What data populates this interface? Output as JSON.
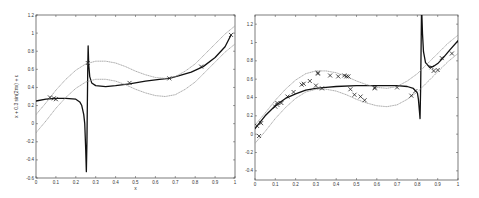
{
  "chart_data": [
    {
      "type": "line",
      "panel": "left",
      "title": "",
      "xlabel": "x",
      "ylabel": "x + 0.3 sin(2πx) + ε",
      "xlim": [
        0,
        1
      ],
      "ylim": [
        -0.6,
        1.2
      ],
      "xticks": [
        0,
        0.1,
        0.2,
        0.3,
        0.4,
        0.5,
        0.6,
        0.7,
        0.8,
        0.9,
        1
      ],
      "xtick_labels": [
        "0",
        "0.1",
        "0.2",
        "0.3",
        "0.4",
        "0.5",
        "0.6",
        "0.7",
        "0.8",
        "0.9",
        "1"
      ],
      "yticks": [
        -0.6,
        -0.4,
        -0.2,
        0,
        0.2,
        0.4,
        0.6,
        0.8,
        1,
        1.2
      ],
      "ytick_labels": [
        "-0.6",
        "-0.4",
        "-0.2",
        "0",
        "0.2",
        "0.4",
        "0.6",
        "0.8",
        "1",
        "1.2"
      ],
      "grid": false,
      "series": [
        {
          "name": "fit",
          "style": "solid",
          "color": "#111111",
          "x": [
            0,
            0.05,
            0.1,
            0.15,
            0.2,
            0.22,
            0.23,
            0.24,
            0.245,
            0.25,
            0.253,
            0.256,
            0.26,
            0.262,
            0.265,
            0.27,
            0.28,
            0.3,
            0.35,
            0.4,
            0.47,
            0.55,
            0.62,
            0.67,
            0.72,
            0.78,
            0.84,
            0.9,
            0.95,
            0.98
          ],
          "y": [
            0.25,
            0.27,
            0.28,
            0.28,
            0.27,
            0.24,
            0.2,
            0.1,
            0.0,
            -0.3,
            -0.53,
            -0.2,
            0.6,
            0.86,
            0.65,
            0.52,
            0.45,
            0.42,
            0.41,
            0.42,
            0.44,
            0.47,
            0.49,
            0.5,
            0.53,
            0.57,
            0.63,
            0.73,
            0.85,
            0.98
          ]
        },
        {
          "name": "upper band",
          "style": "dotted",
          "color": "#999999",
          "x": [
            0,
            0.05,
            0.1,
            0.15,
            0.2,
            0.25,
            0.3,
            0.35,
            0.4,
            0.45,
            0.5,
            0.55,
            0.6,
            0.65,
            0.7,
            0.75,
            0.8,
            0.85,
            0.9,
            0.95,
            1
          ],
          "y": [
            0.1,
            0.23,
            0.37,
            0.49,
            0.59,
            0.66,
            0.69,
            0.69,
            0.67,
            0.63,
            0.58,
            0.54,
            0.51,
            0.5,
            0.52,
            0.58,
            0.66,
            0.77,
            0.88,
            0.99,
            1.08
          ]
        },
        {
          "name": "lower band",
          "style": "dotted",
          "color": "#999999",
          "x": [
            0,
            0.05,
            0.1,
            0.15,
            0.2,
            0.25,
            0.3,
            0.35,
            0.4,
            0.45,
            0.5,
            0.55,
            0.6,
            0.65,
            0.7,
            0.75,
            0.8,
            0.85,
            0.9,
            0.95,
            1
          ],
          "y": [
            -0.1,
            0.03,
            0.17,
            0.29,
            0.39,
            0.46,
            0.49,
            0.49,
            0.47,
            0.43,
            0.38,
            0.34,
            0.31,
            0.3,
            0.32,
            0.38,
            0.46,
            0.57,
            0.68,
            0.79,
            0.88
          ]
        }
      ],
      "points": {
        "name": "data",
        "marker": "x",
        "x": [
          0.07,
          0.09,
          0.1,
          0.26,
          0.47,
          0.67,
          0.83,
          0.98
        ],
        "y": [
          0.29,
          0.28,
          0.27,
          0.67,
          0.45,
          0.5,
          0.63,
          0.98
        ]
      }
    },
    {
      "type": "line",
      "panel": "right",
      "title": "",
      "xlabel": "",
      "ylabel": "",
      "xlim": [
        0,
        1
      ],
      "ylim": [
        -0.5,
        1.3
      ],
      "xticks": [
        0,
        0.1,
        0.2,
        0.3,
        0.4,
        0.5,
        0.6,
        0.7,
        0.8,
        0.9,
        1
      ],
      "xtick_labels": [
        "0",
        "0.1",
        "0.2",
        "0.3",
        "0.4",
        "0.5",
        "0.6",
        "0.7",
        "0.8",
        "0.9",
        "1"
      ],
      "yticks": [
        -0.4,
        -0.2,
        0,
        0.2,
        0.4,
        0.6,
        0.8,
        1,
        1.2
      ],
      "ytick_labels": [
        "-0.4",
        "-0.2",
        "0",
        "0.2",
        "0.4",
        "0.6",
        "0.8",
        "1",
        "1.2"
      ],
      "grid": false,
      "series": [
        {
          "name": "fit",
          "style": "solid",
          "color": "#111111",
          "x": [
            0,
            0.05,
            0.1,
            0.15,
            0.2,
            0.25,
            0.3,
            0.35,
            0.4,
            0.5,
            0.6,
            0.7,
            0.75,
            0.78,
            0.8,
            0.805,
            0.81,
            0.813,
            0.816,
            0.82,
            0.822,
            0.825,
            0.83,
            0.84,
            0.86,
            0.88,
            0.9,
            0.93,
            0.96,
            1
          ],
          "y": [
            0.06,
            0.2,
            0.31,
            0.39,
            0.44,
            0.48,
            0.5,
            0.51,
            0.52,
            0.53,
            0.53,
            0.53,
            0.52,
            0.5,
            0.45,
            0.38,
            0.25,
            0.17,
            0.5,
            1.3,
            1.3,
            1.1,
            0.9,
            0.78,
            0.73,
            0.74,
            0.77,
            0.84,
            0.92,
            1.02
          ]
        },
        {
          "name": "upper band",
          "style": "dotted",
          "color": "#999999",
          "x": [
            0,
            0.05,
            0.1,
            0.15,
            0.2,
            0.25,
            0.3,
            0.35,
            0.4,
            0.45,
            0.5,
            0.55,
            0.6,
            0.65,
            0.7,
            0.75,
            0.8,
            0.85,
            0.9,
            0.95,
            1
          ],
          "y": [
            0.1,
            0.23,
            0.37,
            0.49,
            0.59,
            0.66,
            0.69,
            0.69,
            0.67,
            0.63,
            0.58,
            0.54,
            0.51,
            0.5,
            0.52,
            0.58,
            0.66,
            0.77,
            0.88,
            0.99,
            1.08
          ]
        },
        {
          "name": "lower band",
          "style": "dotted",
          "color": "#999999",
          "x": [
            0,
            0.05,
            0.1,
            0.15,
            0.2,
            0.25,
            0.3,
            0.35,
            0.4,
            0.45,
            0.5,
            0.55,
            0.6,
            0.65,
            0.7,
            0.75,
            0.8,
            0.85,
            0.9,
            0.95,
            1
          ],
          "y": [
            -0.1,
            0.03,
            0.17,
            0.29,
            0.39,
            0.46,
            0.49,
            0.49,
            0.47,
            0.43,
            0.38,
            0.34,
            0.31,
            0.3,
            0.32,
            0.38,
            0.46,
            0.57,
            0.68,
            0.79,
            0.88
          ]
        }
      ],
      "points": {
        "name": "data",
        "marker": "x",
        "x": [
          0.01,
          0.02,
          0.03,
          0.1,
          0.11,
          0.11,
          0.13,
          0.16,
          0.19,
          0.23,
          0.24,
          0.27,
          0.3,
          0.31,
          0.31,
          0.33,
          0.37,
          0.41,
          0.44,
          0.45,
          0.46,
          0.47,
          0.49,
          0.52,
          0.54,
          0.59,
          0.59,
          0.7,
          0.77,
          0.79,
          0.87,
          0.88,
          0.9,
          0.92,
          0.97
        ],
        "y": [
          0.09,
          -0.02,
          0.12,
          0.3,
          0.34,
          0.32,
          0.34,
          0.41,
          0.46,
          0.54,
          0.55,
          0.58,
          0.53,
          0.66,
          0.67,
          0.5,
          0.64,
          0.63,
          0.64,
          0.63,
          0.63,
          0.49,
          0.43,
          0.41,
          0.37,
          0.5,
          0.51,
          0.51,
          0.42,
          0.47,
          0.73,
          0.69,
          0.7,
          0.83,
          0.88
        ]
      }
    }
  ],
  "layout": {
    "panels": [
      {
        "left": 36,
        "top": 15,
        "right": 235,
        "bottom": 178
      },
      {
        "left": 255,
        "top": 15,
        "right": 458,
        "bottom": 180
      }
    ]
  }
}
